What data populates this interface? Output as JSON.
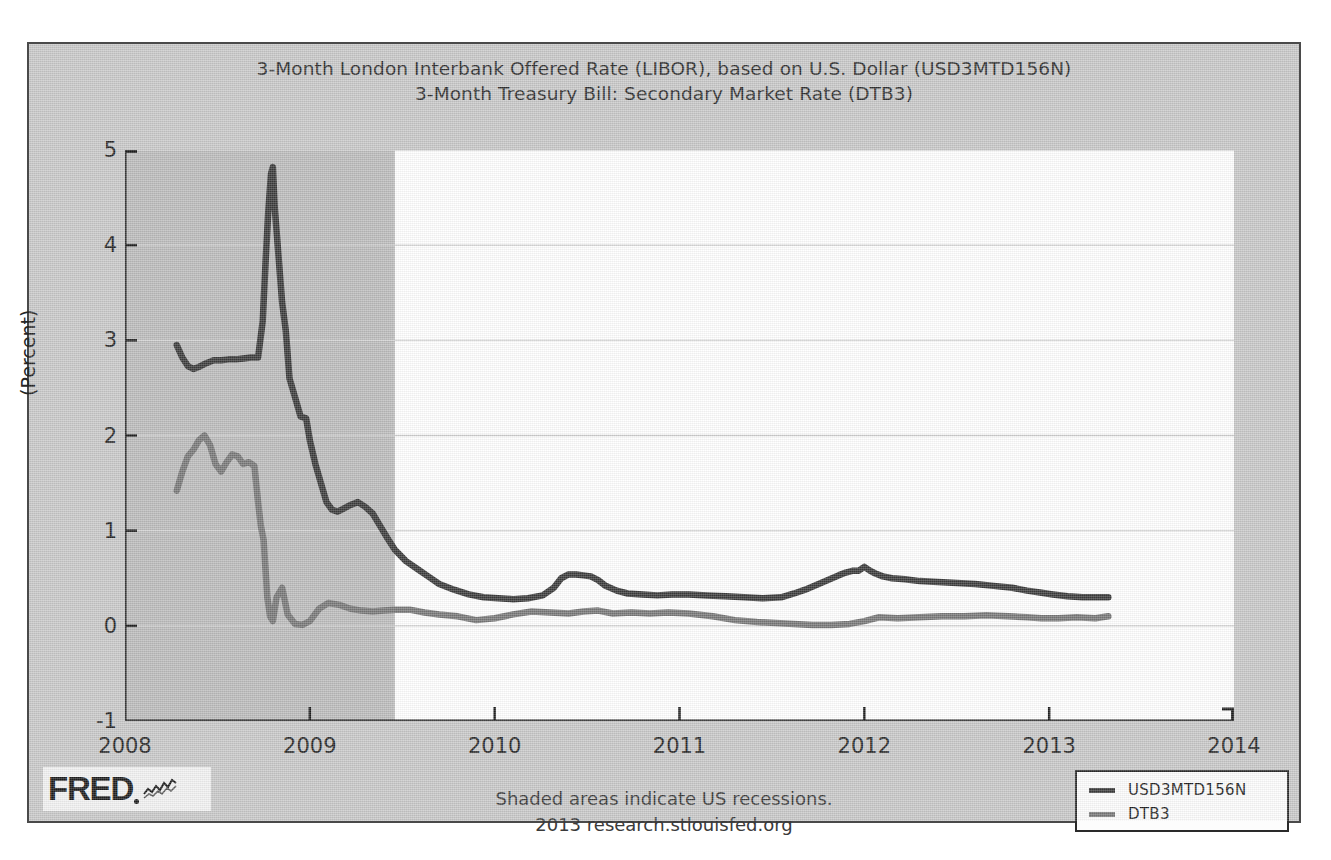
{
  "chart": {
    "title_lines": [
      "3-Month London Interbank Offered Rate (LIBOR), based on U.S. Dollar (USD3MTD156N)",
      "3-Month Treasury Bill: Secondary Market Rate (DTB3)"
    ],
    "footer_lines": [
      "Shaded areas indicate US recessions.",
      "2013 research.stlouisfed.org"
    ],
    "logo": {
      "wordmark": "FRED",
      "squiggle_icon": "fred-chart-squiggle-icon"
    }
  },
  "colors": {
    "series_libor": "#3a3a3a",
    "series_dtb3": "#787878",
    "plot_background": "#ffffff",
    "figure_background": "#c9c9c9",
    "recession_shading": "#bcbcbc",
    "gridline": "#d0d0d0",
    "axis": "#1e1e1e"
  },
  "chart_data": {
    "type": "line",
    "xlabel": "",
    "ylabel": "(Percent)",
    "xlim": [
      2008.0,
      2014.0
    ],
    "ylim": [
      -1,
      5
    ],
    "xticks": [
      "2008",
      "2009",
      "2010",
      "2011",
      "2012",
      "2013",
      "2014"
    ],
    "xtick_values": [
      2008,
      2009,
      2010,
      2011,
      2012,
      2013,
      2014
    ],
    "yticks": [
      "-1",
      "0",
      "1",
      "2",
      "3",
      "4",
      "5"
    ],
    "ytick_values": [
      -1,
      0,
      1,
      2,
      3,
      4,
      5
    ],
    "grid": "horizontal",
    "legend_position": "bottom-right",
    "annotations": [
      "Shaded areas indicate US recessions.",
      "2013 research.stlouisfed.org"
    ],
    "shaded_regions": [
      {
        "label": "US recession (Dec 2007 - Jun 2009)",
        "x_start": 2008.0,
        "x_end": 2009.46
      }
    ],
    "series": [
      {
        "name": "USD3MTD156N",
        "color": "#3a3a3a",
        "x": [
          2008.28,
          2008.31,
          2008.34,
          2008.37,
          2008.4,
          2008.44,
          2008.48,
          2008.52,
          2008.56,
          2008.6,
          2008.64,
          2008.68,
          2008.72,
          2008.745,
          2008.76,
          2008.775,
          2008.79,
          2008.8,
          2008.81,
          2008.83,
          2008.85,
          2008.87,
          2008.89,
          2008.92,
          2008.95,
          2008.98,
          2009.0,
          2009.03,
          2009.06,
          2009.09,
          2009.12,
          2009.15,
          2009.18,
          2009.22,
          2009.26,
          2009.3,
          2009.34,
          2009.38,
          2009.42,
          2009.46,
          2009.52,
          2009.58,
          2009.64,
          2009.7,
          2009.78,
          2009.86,
          2009.94,
          2010.02,
          2010.1,
          2010.18,
          2010.26,
          2010.32,
          2010.36,
          2010.4,
          2010.44,
          2010.48,
          2010.52,
          2010.56,
          2010.6,
          2010.66,
          2010.72,
          2010.8,
          2010.88,
          2010.96,
          2011.05,
          2011.15,
          2011.25,
          2011.35,
          2011.45,
          2011.55,
          2011.62,
          2011.68,
          2011.74,
          2011.8,
          2011.86,
          2011.9,
          2011.94,
          2011.97,
          2012.0,
          2012.03,
          2012.06,
          2012.1,
          2012.15,
          2012.22,
          2012.3,
          2012.4,
          2012.5,
          2012.6,
          2012.7,
          2012.8,
          2012.88,
          2012.95,
          2013.02,
          2013.1,
          2013.18,
          2013.26,
          2013.32
        ],
        "y": [
          2.95,
          2.82,
          2.73,
          2.7,
          2.72,
          2.76,
          2.79,
          2.79,
          2.8,
          2.8,
          2.81,
          2.82,
          2.82,
          3.2,
          3.8,
          4.35,
          4.75,
          4.82,
          4.4,
          3.9,
          3.4,
          3.1,
          2.6,
          2.4,
          2.2,
          2.18,
          1.95,
          1.7,
          1.5,
          1.3,
          1.22,
          1.2,
          1.23,
          1.27,
          1.3,
          1.25,
          1.18,
          1.05,
          0.92,
          0.8,
          0.68,
          0.6,
          0.52,
          0.44,
          0.38,
          0.33,
          0.3,
          0.29,
          0.28,
          0.29,
          0.32,
          0.4,
          0.5,
          0.54,
          0.54,
          0.53,
          0.52,
          0.48,
          0.42,
          0.37,
          0.34,
          0.33,
          0.32,
          0.33,
          0.33,
          0.32,
          0.31,
          0.3,
          0.29,
          0.3,
          0.34,
          0.38,
          0.43,
          0.48,
          0.53,
          0.56,
          0.58,
          0.58,
          0.62,
          0.58,
          0.55,
          0.52,
          0.5,
          0.49,
          0.47,
          0.46,
          0.45,
          0.44,
          0.42,
          0.4,
          0.37,
          0.35,
          0.33,
          0.31,
          0.3,
          0.3,
          0.3
        ]
      },
      {
        "name": "DTB3",
        "color": "#787878",
        "x": [
          2008.28,
          2008.31,
          2008.34,
          2008.37,
          2008.4,
          2008.43,
          2008.46,
          2008.49,
          2008.52,
          2008.55,
          2008.58,
          2008.61,
          2008.64,
          2008.67,
          2008.7,
          2008.72,
          2008.735,
          2008.75,
          2008.76,
          2008.77,
          2008.785,
          2008.8,
          2008.82,
          2008.85,
          2008.88,
          2008.92,
          2008.96,
          2009.0,
          2009.05,
          2009.1,
          2009.16,
          2009.22,
          2009.28,
          2009.34,
          2009.4,
          2009.46,
          2009.54,
          2009.62,
          2009.7,
          2009.8,
          2009.9,
          2010.0,
          2010.1,
          2010.2,
          2010.3,
          2010.4,
          2010.48,
          2010.56,
          2010.64,
          2010.74,
          2010.84,
          2010.94,
          2011.05,
          2011.18,
          2011.3,
          2011.42,
          2011.52,
          2011.62,
          2011.72,
          2011.82,
          2011.92,
          2012.0,
          2012.08,
          2012.18,
          2012.3,
          2012.42,
          2012.54,
          2012.66,
          2012.78,
          2012.88,
          2012.96,
          2013.05,
          2013.15,
          2013.25,
          2013.32
        ],
        "y": [
          1.42,
          1.62,
          1.78,
          1.85,
          1.95,
          2.0,
          1.9,
          1.7,
          1.62,
          1.72,
          1.8,
          1.78,
          1.7,
          1.72,
          1.68,
          1.3,
          1.05,
          0.9,
          0.6,
          0.3,
          0.1,
          0.05,
          0.3,
          0.4,
          0.12,
          0.02,
          0.01,
          0.05,
          0.18,
          0.24,
          0.22,
          0.18,
          0.16,
          0.15,
          0.16,
          0.17,
          0.17,
          0.14,
          0.12,
          0.1,
          0.06,
          0.08,
          0.12,
          0.15,
          0.14,
          0.13,
          0.15,
          0.16,
          0.13,
          0.14,
          0.13,
          0.14,
          0.13,
          0.1,
          0.06,
          0.04,
          0.03,
          0.02,
          0.01,
          0.01,
          0.02,
          0.05,
          0.09,
          0.08,
          0.09,
          0.1,
          0.1,
          0.11,
          0.1,
          0.09,
          0.08,
          0.08,
          0.09,
          0.08,
          0.1
        ]
      }
    ]
  },
  "legend": {
    "items": [
      {
        "label": "USD3MTD156N",
        "color": "#3a3a3a"
      },
      {
        "label": "DTB3",
        "color": "#787878"
      }
    ]
  }
}
